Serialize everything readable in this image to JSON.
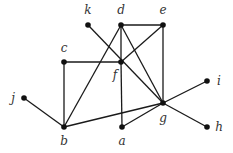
{
  "graph": {
    "nodes": [
      {
        "id": "a",
        "x": 122,
        "y": 127,
        "lx": 122,
        "ly": 145
      },
      {
        "id": "b",
        "x": 64,
        "y": 127,
        "lx": 64,
        "ly": 145
      },
      {
        "id": "c",
        "x": 64,
        "y": 62,
        "lx": 64,
        "ly": 52
      },
      {
        "id": "d",
        "x": 121,
        "y": 25,
        "lx": 121,
        "ly": 14
      },
      {
        "id": "e",
        "x": 163,
        "y": 25,
        "lx": 163,
        "ly": 14
      },
      {
        "id": "f",
        "x": 121,
        "y": 62,
        "lx": 115,
        "ly": 79
      },
      {
        "id": "g",
        "x": 163,
        "y": 103,
        "lx": 163,
        "ly": 122
      },
      {
        "id": "h",
        "x": 207,
        "y": 127,
        "lx": 219,
        "ly": 131
      },
      {
        "id": "i",
        "x": 207,
        "y": 81,
        "lx": 219,
        "ly": 85
      },
      {
        "id": "j",
        "x": 24,
        "y": 98,
        "lx": 13,
        "ly": 102
      },
      {
        "id": "k",
        "x": 88,
        "y": 25,
        "lx": 88,
        "ly": 14
      }
    ],
    "edges": [
      [
        "d",
        "e"
      ],
      [
        "d",
        "f"
      ],
      [
        "f",
        "a"
      ],
      [
        "d",
        "b"
      ],
      [
        "d",
        "g"
      ],
      [
        "k",
        "g"
      ],
      [
        "e",
        "f"
      ],
      [
        "e",
        "g"
      ],
      [
        "c",
        "f"
      ],
      [
        "c",
        "b"
      ],
      [
        "j",
        "b"
      ],
      [
        "b",
        "g"
      ],
      [
        "a",
        "g"
      ],
      [
        "g",
        "i"
      ],
      [
        "g",
        "h"
      ]
    ]
  }
}
